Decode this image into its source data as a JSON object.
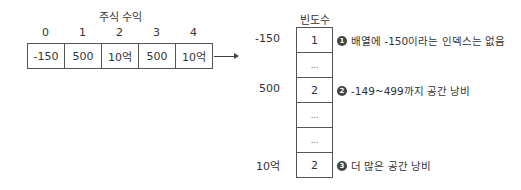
{
  "array": {
    "title": "주식 수익",
    "indices": [
      "0",
      "1",
      "2",
      "3",
      "4"
    ],
    "values": [
      "-150",
      "500",
      "10억",
      "500",
      "10억"
    ]
  },
  "frequency": {
    "title": "빈도수",
    "cells": [
      "1",
      "...",
      "2",
      "...",
      "...",
      "2"
    ],
    "row_labels": [
      {
        "text": "-150",
        "row": 0
      },
      {
        "text": "500",
        "row": 2
      },
      {
        "text": "10억",
        "row": 5
      }
    ]
  },
  "notes": [
    {
      "badge": "1",
      "text": "배열에 -150이라는 인덱스는 없음",
      "row": 0
    },
    {
      "badge": "2",
      "text": "-149~499까지 공간 낭비",
      "row": 2
    },
    {
      "badge": "3",
      "text": "더 많은 공간 낭비",
      "row": 5
    }
  ],
  "colors": {
    "border": "#555555",
    "text": "#333333",
    "badge": "#444444"
  }
}
